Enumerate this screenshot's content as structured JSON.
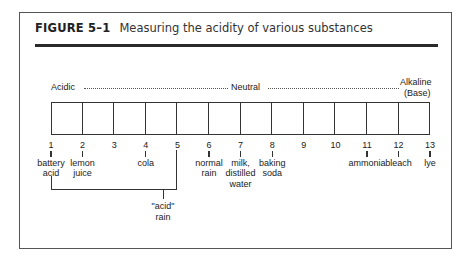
{
  "figure": {
    "label": "FIGURE 5–1",
    "caption": "Measuring the acidity of various substances"
  },
  "scale": {
    "acidic_label": "Acidic",
    "neutral_label": "Neutral",
    "alkaline_label": "Alkaline",
    "alkaline_sub": "(Base)",
    "cell_count": 12
  },
  "ticks": [
    {
      "num": "1",
      "line1": "battery",
      "line2": "acid",
      "line3": ""
    },
    {
      "num": "2",
      "line1": "lemon",
      "line2": "juice",
      "line3": ""
    },
    {
      "num": "3",
      "line1": "",
      "line2": "",
      "line3": ""
    },
    {
      "num": "4",
      "line1": "cola",
      "line2": "",
      "line3": ""
    },
    {
      "num": "5",
      "line1": "",
      "line2": "",
      "line3": ""
    },
    {
      "num": "6",
      "line1": "normal",
      "line2": "rain",
      "line3": ""
    },
    {
      "num": "7",
      "line1": "milk,",
      "line2": "distilled",
      "line3": "water"
    },
    {
      "num": "8",
      "line1": "baking",
      "line2": "soda",
      "line3": ""
    },
    {
      "num": "9",
      "line1": "",
      "line2": "",
      "line3": ""
    },
    {
      "num": "10",
      "line1": "",
      "line2": "",
      "line3": ""
    },
    {
      "num": "11",
      "line1": "ammonia",
      "line2": "",
      "line3": ""
    },
    {
      "num": "12",
      "line1": "bleach",
      "line2": "",
      "line3": ""
    },
    {
      "num": "13",
      "line1": "lye",
      "line2": "",
      "line3": ""
    }
  ],
  "bracket": {
    "label_line1": "\"acid\"",
    "label_line2": "rain",
    "range": [
      "1",
      "5"
    ]
  }
}
